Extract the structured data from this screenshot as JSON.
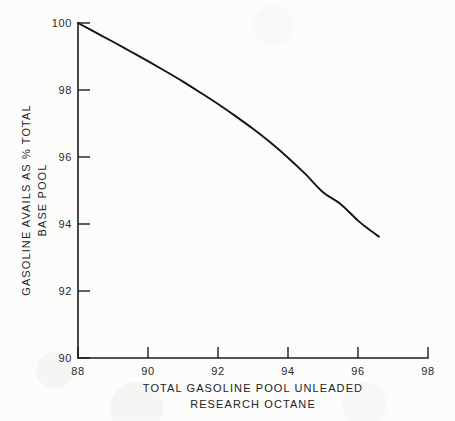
{
  "chart_data": {
    "type": "line",
    "title": "",
    "xlabel": "TOTAL GASOLINE POOL UNLEADED RESEARCH OCTANE",
    "xlabel_line1": "TOTAL GASOLINE POOL UNLEADED",
    "xlabel_line2": "RESEARCH OCTANE",
    "ylabel": "GASOLINE AVAILS AS % TOTAL BASE POOL",
    "ylabel_line1": "GASOLINE AVAILS AS % TOTAL",
    "ylabel_line2": "BASE POOL",
    "xlim": [
      88,
      98
    ],
    "ylim": [
      90,
      100
    ],
    "xticks": [
      88,
      90,
      92,
      94,
      96,
      98
    ],
    "yticks": [
      90,
      92,
      94,
      96,
      98,
      100
    ],
    "xtick_labels": [
      "88",
      "90",
      "92",
      "94",
      "96",
      "98"
    ],
    "ytick_labels": [
      "90",
      "92",
      "94",
      "96",
      "98",
      "100"
    ],
    "grid": false,
    "legend": false,
    "legend_position": "none",
    "line_color": "#141414",
    "series": [
      {
        "name": "Gasoline availability vs pool octane",
        "x": [
          88.0,
          88.5,
          89.0,
          89.5,
          90.0,
          90.5,
          91.0,
          91.5,
          92.0,
          92.5,
          93.0,
          93.5,
          94.0,
          94.5,
          95.0,
          95.5,
          96.0,
          96.3,
          96.6
        ],
        "y": [
          100.0,
          99.72,
          99.44,
          99.15,
          98.86,
          98.56,
          98.25,
          97.92,
          97.58,
          97.22,
          96.84,
          96.43,
          95.98,
          95.49,
          94.95,
          94.6,
          94.1,
          93.85,
          93.62
        ]
      }
    ]
  },
  "geometry": {
    "plot_left_px": 78,
    "plot_right_px": 428,
    "plot_top_px": 23,
    "plot_bottom_px": 358
  },
  "meta": {
    "figure_name": "gasoline-availability-vs-octane-chart"
  }
}
